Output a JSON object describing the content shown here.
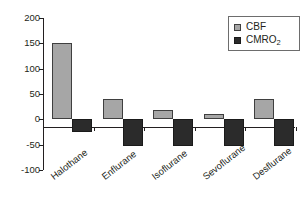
{
  "chart_data": {
    "type": "bar",
    "title": "",
    "xlabel": "",
    "ylabel": "",
    "categories": [
      "Halothane",
      "Enflurane",
      "Isoflurane",
      "Sevoflurane",
      "Desflurane"
    ],
    "series": [
      {
        "name": "CBF",
        "color": "#a6a6a6",
        "values": [
          150,
          40,
          19,
          10,
          40
        ]
      },
      {
        "name": "CMRO2",
        "color": "#2b2b2b",
        "values": [
          -25,
          -52,
          -53,
          -52,
          -52
        ]
      }
    ],
    "ylim": [
      -100,
      200
    ],
    "yticks": [
      200,
      150,
      100,
      50,
      0,
      -50,
      -100
    ],
    "ytick_labels": [
      "200",
      "150",
      "100",
      "50",
      "0",
      "-50",
      "-100"
    ],
    "grid": false,
    "legend_position": "top-right",
    "legend_entries": [
      {
        "label": "CBF",
        "sub": "",
        "swatch": "cbf"
      },
      {
        "label": "CMRO",
        "sub": "2",
        "swatch": "cmro2"
      }
    ]
  }
}
